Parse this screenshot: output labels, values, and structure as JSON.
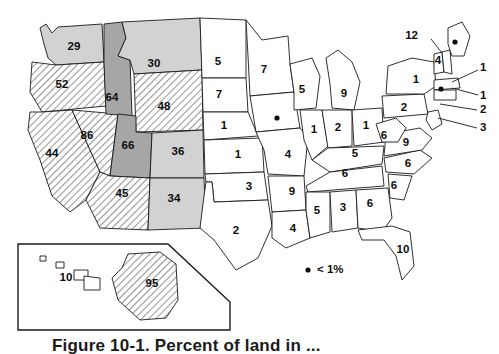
{
  "figure": {
    "caption": "Figure 10-1.  Percent of land in ...",
    "legend": {
      "marker": "dot-marker",
      "text": "< 1%"
    }
  },
  "fill_classes": {
    "white": "fill-white",
    "light": "fill-light",
    "dark": "fill-dark",
    "hatch": "fill-hatch"
  },
  "chart_data": {
    "type": "map",
    "units": "percent",
    "legend": [
      {
        "label": "< 1%",
        "symbol": "dot"
      }
    ],
    "fill_levels": [
      "white",
      "light",
      "dark",
      "hatch"
    ],
    "categories": [
      "WA",
      "OR",
      "CA",
      "NV",
      "ID",
      "MT",
      "WY",
      "UT",
      "CO",
      "AZ",
      "NM",
      "ND",
      "SD",
      "NE",
      "KS",
      "OK",
      "TX",
      "MN",
      "IA",
      "MO",
      "AR",
      "LA",
      "WI",
      "IL",
      "MI",
      "IN",
      "OH",
      "KY",
      "TN",
      "MS",
      "AL",
      "GA",
      "FL",
      "SC",
      "NC",
      "VA",
      "WV",
      "PA",
      "NY",
      "VT",
      "NH",
      "ME",
      "MA",
      "RI",
      "CT",
      "NJ",
      "DE",
      "MD",
      "AK",
      "HI"
    ],
    "values": [
      29,
      52,
      44,
      86,
      64,
      30,
      48,
      66,
      36,
      45,
      34,
      5,
      7,
      1,
      1,
      3,
      2,
      7,
      0.5,
      4,
      9,
      4,
      5,
      1,
      9,
      2,
      1,
      5,
      6,
      5,
      3,
      6,
      10,
      6,
      6,
      9,
      6,
      2,
      1,
      12,
      4,
      0.5,
      1,
      1,
      1,
      2,
      3,
      3,
      95,
      10
    ],
    "points": [
      {
        "state": "WA",
        "label": "29",
        "value": 29,
        "fill": "light",
        "x": 74,
        "y": 47
      },
      {
        "state": "OR",
        "label": "52",
        "value": 52,
        "fill": "hatch",
        "x": 62,
        "y": 85
      },
      {
        "state": "CA",
        "label": "44",
        "value": 44,
        "fill": "hatch",
        "x": 52,
        "y": 154
      },
      {
        "state": "NV",
        "label": "86",
        "value": 86,
        "fill": "hatch",
        "x": 87,
        "y": 136
      },
      {
        "state": "ID",
        "label": "64",
        "value": 64,
        "fill": "dark",
        "x": 112,
        "y": 98
      },
      {
        "state": "MT",
        "label": "30",
        "value": 30,
        "fill": "light",
        "x": 154,
        "y": 64
      },
      {
        "state": "WY",
        "label": "48",
        "value": 48,
        "fill": "hatch",
        "x": 164,
        "y": 107
      },
      {
        "state": "UT",
        "label": "66",
        "value": 66,
        "fill": "dark",
        "x": 128,
        "y": 146
      },
      {
        "state": "CO",
        "label": "36",
        "value": 36,
        "fill": "light",
        "x": 178,
        "y": 152
      },
      {
        "state": "AZ",
        "label": "45",
        "value": 45,
        "fill": "hatch",
        "x": 122,
        "y": 194
      },
      {
        "state": "NM",
        "label": "34",
        "value": 34,
        "fill": "light",
        "x": 174,
        "y": 199
      },
      {
        "state": "ND",
        "label": "5",
        "value": 5,
        "fill": "white",
        "x": 218,
        "y": 62
      },
      {
        "state": "SD",
        "label": "7",
        "value": 7,
        "fill": "white",
        "x": 219,
        "y": 95
      },
      {
        "state": "NE",
        "label": "1",
        "value": 1,
        "fill": "white",
        "x": 224,
        "y": 126
      },
      {
        "state": "KS",
        "label": "1",
        "value": 1,
        "fill": "white",
        "x": 238,
        "y": 155
      },
      {
        "state": "OK",
        "label": "3",
        "value": 3,
        "fill": "white",
        "x": 249,
        "y": 187
      },
      {
        "state": "TX",
        "label": "2",
        "value": 2,
        "fill": "white",
        "x": 236,
        "y": 231
      },
      {
        "state": "MN",
        "label": "7",
        "value": 7,
        "fill": "white",
        "x": 264,
        "y": 70
      },
      {
        "state": "IA",
        "label": "",
        "value": 0.5,
        "fill": "white",
        "x": 277,
        "y": 118,
        "dot": true
      },
      {
        "state": "MO",
        "label": "4",
        "value": 4,
        "fill": "white",
        "x": 288,
        "y": 155
      },
      {
        "state": "AR",
        "label": "9",
        "value": 9,
        "fill": "white",
        "x": 292,
        "y": 192
      },
      {
        "state": "LA",
        "label": "4",
        "value": 4,
        "fill": "white",
        "x": 293,
        "y": 229
      },
      {
        "state": "WI",
        "label": "5",
        "value": 5,
        "fill": "white",
        "x": 302,
        "y": 90
      },
      {
        "state": "IL",
        "label": "1",
        "value": 1,
        "fill": "white",
        "x": 314,
        "y": 130
      },
      {
        "state": "MI",
        "label": "9",
        "value": 9,
        "fill": "white",
        "x": 344,
        "y": 94
      },
      {
        "state": "IN",
        "label": "2",
        "value": 2,
        "fill": "white",
        "x": 338,
        "y": 128
      },
      {
        "state": "OH",
        "label": "1",
        "value": 1,
        "fill": "white",
        "x": 366,
        "y": 126
      },
      {
        "state": "KY",
        "label": "5",
        "value": 5,
        "fill": "white",
        "x": 355,
        "y": 154
      },
      {
        "state": "TN",
        "label": "6",
        "value": 6,
        "fill": "white",
        "x": 345,
        "y": 174
      },
      {
        "state": "MS",
        "label": "5",
        "value": 5,
        "fill": "white",
        "x": 317,
        "y": 211
      },
      {
        "state": "AL",
        "label": "3",
        "value": 3,
        "fill": "white",
        "x": 343,
        "y": 208
      },
      {
        "state": "GA",
        "label": "6",
        "value": 6,
        "fill": "white",
        "x": 370,
        "y": 204
      },
      {
        "state": "FL",
        "label": "10",
        "value": 10,
        "fill": "white",
        "x": 403,
        "y": 250
      },
      {
        "state": "SC",
        "label": "6",
        "value": 6,
        "fill": "white",
        "x": 394,
        "y": 186
      },
      {
        "state": "NC",
        "label": "6",
        "value": 6,
        "fill": "white",
        "x": 408,
        "y": 164
      },
      {
        "state": "VA",
        "label": "9",
        "value": 9,
        "fill": "white",
        "x": 406,
        "y": 143
      },
      {
        "state": "WV",
        "label": "6",
        "value": 6,
        "fill": "white",
        "x": 384,
        "y": 136
      },
      {
        "state": "PA",
        "label": "2",
        "value": 2,
        "fill": "white",
        "x": 404,
        "y": 108
      },
      {
        "state": "NY",
        "label": "1",
        "value": 1,
        "fill": "white",
        "x": 416,
        "y": 80
      },
      {
        "state": "ME",
        "label": "",
        "value": 0.5,
        "fill": "white",
        "x": 455,
        "y": 42,
        "dot": true
      },
      {
        "state": "MA",
        "label": "",
        "value": 1,
        "fill": "white",
        "x": 441,
        "y": 89,
        "dot": true
      }
    ],
    "callouts": [
      {
        "state": "VT",
        "label": "12",
        "value": 12,
        "x": 418,
        "y": 36,
        "tx": 424,
        "ty": 36,
        "lx1": 431,
        "ly1": 39,
        "lx2": 442,
        "ly2": 53
      },
      {
        "state": "NH",
        "label": "4",
        "value": 4,
        "x": 438,
        "y": 61,
        "inline": true
      },
      {
        "state": "MA",
        "label": "1",
        "value": 1,
        "x": 480,
        "y": 68,
        "tx": 480,
        "ty": 68,
        "lx1": 478,
        "ly1": 70,
        "lx2": 452,
        "ly2": 82
      },
      {
        "state": "RI",
        "label": "1",
        "value": 1,
        "x": 480,
        "y": 96,
        "tx": 480,
        "ty": 96,
        "lx1": 478,
        "ly1": 95,
        "lx2": 452,
        "ly2": 88
      },
      {
        "state": "CT",
        "label": "2",
        "value": 2,
        "x": 480,
        "y": 110,
        "tx": 480,
        "ty": 110,
        "lx1": 477,
        "ly1": 110,
        "lx2": 440,
        "ly2": 104
      },
      {
        "state": "NJ",
        "label": "3",
        "value": 3,
        "x": 480,
        "y": 128,
        "tx": 480,
        "ty": 128,
        "lx1": 477,
        "ly1": 128,
        "lx2": 438,
        "ly2": 118
      }
    ],
    "inset": {
      "label": "alaska-hawaii-inset",
      "items": [
        {
          "state": "HI",
          "label": "10",
          "value": 10,
          "fill": "white",
          "x": 66,
          "y": 278
        },
        {
          "state": "AK",
          "label": "95",
          "value": 95,
          "fill": "hatch",
          "x": 152,
          "y": 284
        }
      ]
    }
  }
}
